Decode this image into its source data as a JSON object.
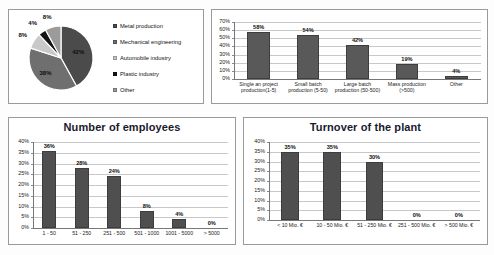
{
  "chart_data": [
    {
      "id": "industry",
      "type": "pie",
      "title": "",
      "categories": [
        "Metal production",
        "Mechanical engineering",
        "Automobile industry",
        "Plastic industry",
        "Other"
      ],
      "values": [
        42,
        38,
        8,
        4,
        8
      ],
      "value_labels": [
        "42%",
        "38%",
        "8%",
        "4%",
        "8%"
      ],
      "colors": [
        "#4b4b4b",
        "#6f6f6f",
        "#c9c9c9",
        "#141414",
        "#9b9b9b"
      ],
      "legend_position": "right",
      "grid": false
    },
    {
      "id": "production",
      "type": "bar",
      "title": "",
      "categories": [
        "Single an project production(1-5)",
        "Small batch production (5-50)",
        "Large batch production (50-500)",
        "Mass production (>500)",
        "Other"
      ],
      "values": [
        58,
        54,
        42,
        19,
        4
      ],
      "value_labels": [
        "58%",
        "54%",
        "42%",
        "19%",
        "4%"
      ],
      "yticks": [
        "0%",
        "10%",
        "20%",
        "30%",
        "40%",
        "50%",
        "60%",
        "70%"
      ],
      "ylim": [
        0,
        70
      ],
      "ylabel": "",
      "xlabel": "",
      "grid": true,
      "bar_color": "#595959"
    },
    {
      "id": "employees",
      "type": "bar",
      "title": "Number of employees",
      "categories": [
        "1 - 50",
        "51 - 250",
        "251 - 500",
        "501 - 1000",
        "1001 - 5000",
        "> 5000"
      ],
      "values": [
        36,
        28,
        24,
        8,
        4,
        0
      ],
      "value_labels": [
        "36%",
        "28%",
        "24%",
        "8%",
        "4%",
        "0%"
      ],
      "yticks": [
        "0%",
        "5%",
        "10%",
        "15%",
        "20%",
        "25%",
        "30%",
        "35%",
        "40%"
      ],
      "ylim": [
        0,
        40
      ],
      "ylabel": "",
      "xlabel": "",
      "grid": true,
      "bar_color": "#4f4f4f"
    },
    {
      "id": "turnover",
      "type": "bar",
      "title": "Turnover of the plant",
      "categories": [
        "< 10 Mio. €",
        "10 - 50 Mio. €",
        "51 - 250 Mio. €",
        "251 - 500 Mio. €",
        "> 500 Mio. €"
      ],
      "values": [
        35,
        35,
        30,
        0,
        0
      ],
      "value_labels": [
        "35%",
        "35%",
        "30%",
        "0%",
        "0%"
      ],
      "yticks": [
        "0%",
        "5%",
        "10%",
        "15%",
        "20%",
        "25%",
        "30%",
        "35%",
        "40%"
      ],
      "ylim": [
        0,
        40
      ],
      "ylabel": "",
      "xlabel": "",
      "grid": true,
      "bar_color": "#4f4f4f"
    }
  ]
}
